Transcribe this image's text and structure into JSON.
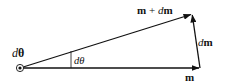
{
  "diagram": {
    "type": "vector-addition",
    "labels": {
      "origin": "dθ",
      "origin_italic": "d",
      "origin_bold": "θ",
      "angle": "dθ",
      "vector_m": "m",
      "vector_dm_d": "d",
      "vector_dm_m": "m",
      "vector_sum_m": "m",
      "vector_sum_plus": " + ",
      "vector_sum_d": "d",
      "vector_sum_dm": "m"
    },
    "vectors": [
      {
        "name": "m",
        "from": [
          20,
          68
        ],
        "to": [
          200,
          68
        ]
      },
      {
        "name": "m + dm",
        "from": [
          20,
          68
        ],
        "to": [
          192,
          14
        ]
      },
      {
        "name": "dm",
        "from": [
          200,
          68
        ],
        "to": [
          192,
          14
        ]
      }
    ],
    "colors": {
      "stroke": "#111111",
      "background": "#ffffff"
    }
  }
}
